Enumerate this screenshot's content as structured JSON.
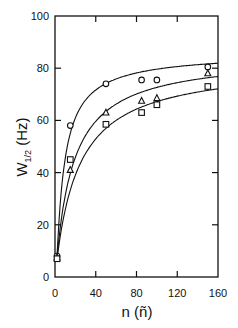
{
  "chart_data": {
    "type": "scatter",
    "title": "",
    "xlabel": "n (ñ)",
    "ylabel": "W1/2 (Hz)",
    "xlim": [
      0,
      160
    ],
    "ylim": [
      0,
      100
    ],
    "xticks": [
      0,
      40,
      80,
      120,
      160
    ],
    "yticks": [
      0,
      20,
      40,
      60,
      80,
      100
    ],
    "grid": false,
    "legend": "none",
    "series": [
      {
        "name": "circle",
        "marker": "circle",
        "x": [
          2,
          15,
          50,
          85,
          100,
          150
        ],
        "y": [
          8,
          58,
          74,
          75.5,
          75.5,
          80.5
        ],
        "fit": {
          "a": 86,
          "k": 8
        }
      },
      {
        "name": "triangle",
        "marker": "triangle",
        "x": [
          2,
          15,
          50,
          85,
          100,
          150
        ],
        "y": [
          7.5,
          41,
          63,
          67.5,
          68.5,
          78
        ],
        "fit": {
          "a": 85,
          "k": 17
        }
      },
      {
        "name": "square",
        "marker": "square",
        "x": [
          2,
          15,
          50,
          85,
          100,
          150
        ],
        "y": [
          7,
          45,
          58.5,
          63,
          66,
          73
        ],
        "fit": {
          "a": 82,
          "k": 22
        }
      }
    ]
  },
  "labels": {
    "xlabel_main": "n (",
    "xlabel_tilde": "ñ",
    "xlabel_close": ")",
    "ylabel_main": "W",
    "ylabel_sub": "1/2",
    "ylabel_unit": " (Hz)"
  }
}
